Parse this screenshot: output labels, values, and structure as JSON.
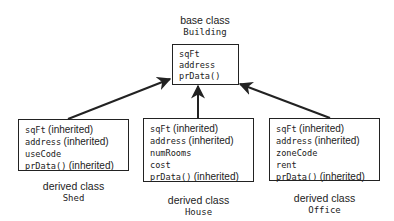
{
  "base": {
    "caption": "base class",
    "name": "Building",
    "members": [
      {
        "code": "sqFt",
        "note": ""
      },
      {
        "code": "address",
        "note": ""
      },
      {
        "code": "prData()",
        "note": ""
      }
    ]
  },
  "derived": [
    {
      "caption": "derived class",
      "name": "Shed",
      "members": [
        {
          "code": "sqFt",
          "note": "(inherited)"
        },
        {
          "code": "address",
          "note": "(inherited)"
        },
        {
          "code": "useCode",
          "note": ""
        },
        {
          "code": "prData()",
          "note": "(inherited)"
        }
      ]
    },
    {
      "caption": "derived class",
      "name": "House",
      "members": [
        {
          "code": "sqFt",
          "note": "(inherited)"
        },
        {
          "code": "address",
          "note": "(inherited)"
        },
        {
          "code": "numRooms",
          "note": ""
        },
        {
          "code": "cost",
          "note": ""
        },
        {
          "code": "prData()",
          "note": "(inherited)"
        }
      ]
    },
    {
      "caption": "derived class",
      "name": "Office",
      "members": [
        {
          "code": "sqFt",
          "note": "(inherited)"
        },
        {
          "code": "address",
          "note": "(inherited)"
        },
        {
          "code": "zoneCode",
          "note": ""
        },
        {
          "code": "rent",
          "note": ""
        },
        {
          "code": "prData()",
          "note": "(inherited)"
        }
      ]
    }
  ],
  "colors": {
    "stroke": "#222222",
    "background": "#ffffff"
  }
}
